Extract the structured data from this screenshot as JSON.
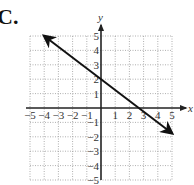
{
  "panel_label": "C.",
  "chart_data": {
    "type": "line",
    "title": "",
    "xlabel": "x",
    "ylabel": "y",
    "xlim": [
      -5,
      5
    ],
    "ylim": [
      -5,
      5
    ],
    "grid": true,
    "grid_style": "dotted",
    "x_ticks": [
      -5,
      -4,
      -3,
      -2,
      -1,
      1,
      2,
      3,
      4,
      5
    ],
    "y_ticks": [
      5,
      4,
      3,
      2,
      1,
      -1,
      -2,
      -3,
      -4,
      -5
    ],
    "x_tick_labels": [
      "−5",
      "−4",
      "−3",
      "−2",
      "−1",
      "1",
      "2",
      "3",
      "4",
      "5"
    ],
    "y_tick_labels": [
      "5",
      "4",
      "3",
      "2",
      "1",
      "−1",
      "−2",
      "−3",
      "−4",
      "−5"
    ],
    "series": [
      {
        "name": "line",
        "equation": "y = -3/4 x + 2",
        "slope": -0.75,
        "intercept": 2,
        "x": [
          -4,
          5
        ],
        "y": [
          5,
          -1.75
        ],
        "arrows": "both"
      }
    ],
    "x_intercept": 2.67,
    "y_intercept": 2
  },
  "colors": {
    "axis": "#222222",
    "grid": "#9a9a9a",
    "line": "#111111",
    "text": "#333333"
  }
}
